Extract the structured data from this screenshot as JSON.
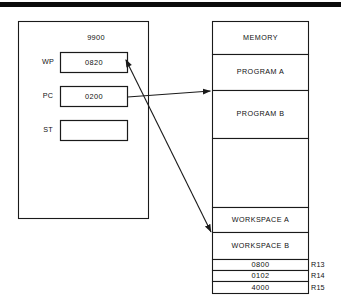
{
  "figure": {
    "scan_artifact_color": "#0b0b0b"
  },
  "cpu_block": {
    "title": "9900",
    "registers": [
      {
        "name": "WP",
        "label": "WP",
        "value": "0820"
      },
      {
        "name": "PC",
        "label": "PC",
        "value": "0200"
      },
      {
        "name": "ST",
        "label": "ST",
        "value": ""
      }
    ]
  },
  "memory_block": {
    "cells": [
      {
        "label": "MEMORY"
      },
      {
        "label": "PROGRAM A"
      },
      {
        "label": "PROGRAM B"
      },
      {
        "label": ""
      },
      {
        "label": "WORKSPACE A"
      },
      {
        "label": "WORKSPACE B"
      }
    ],
    "register_rows": [
      {
        "value": "0800",
        "register": "R13"
      },
      {
        "value": "0102",
        "register": "R14"
      },
      {
        "value": "4000",
        "register": "R15"
      }
    ]
  },
  "connectors": [
    {
      "name": "pc-to-program-b",
      "from": "PC",
      "to": "PROGRAM B"
    },
    {
      "name": "wp-to-workspace-b",
      "from": "WP",
      "to": "WORKSPACE B"
    }
  ]
}
